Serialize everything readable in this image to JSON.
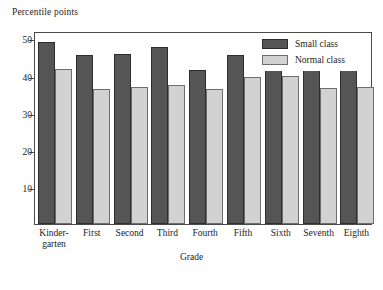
{
  "chart_data": {
    "type": "bar",
    "title": "",
    "ylabel": "Percentile points",
    "xlabel": "Grade",
    "ylim": [
      0,
      52
    ],
    "yticks": [
      10,
      20,
      30,
      40,
      50
    ],
    "ytick_labels": [
      "10",
      "20",
      "30",
      "40",
      "50"
    ],
    "grid": false,
    "legend_position": "top-right",
    "categories": [
      "Kinder-\ngarten",
      "First",
      "Second",
      "Third",
      "Fourth",
      "Fifth",
      "Sixth",
      "Seventh",
      "Eighth"
    ],
    "category_lines": [
      [
        "Kinder-",
        "garten"
      ],
      [
        "First"
      ],
      [
        "Second"
      ],
      [
        "Third"
      ],
      [
        "Fourth"
      ],
      [
        "Fifth"
      ],
      [
        "Sixth"
      ],
      [
        "Seventh"
      ],
      [
        "Eighth"
      ]
    ],
    "series": [
      {
        "name": "Small class",
        "color": "#555556",
        "values": [
          49.0,
          45.5,
          45.7,
          47.8,
          41.6,
          45.6,
          45.1,
          41.6,
          41.4
        ]
      },
      {
        "name": "Normal class",
        "color": "#d2d2d2",
        "values": [
          41.7,
          36.4,
          36.9,
          37.5,
          36.4,
          39.7,
          40.0,
          36.7,
          36.8
        ]
      }
    ]
  },
  "legend": {
    "items": [
      {
        "label": "Small class",
        "swatch": "small"
      },
      {
        "label": "Normal class",
        "swatch": "normal"
      }
    ]
  },
  "colors": {
    "small_class": "#555556",
    "normal_class": "#d2d2d2",
    "frame": "#4a4a4a",
    "text": "#1c1c1c",
    "background": "#ffffff"
  }
}
